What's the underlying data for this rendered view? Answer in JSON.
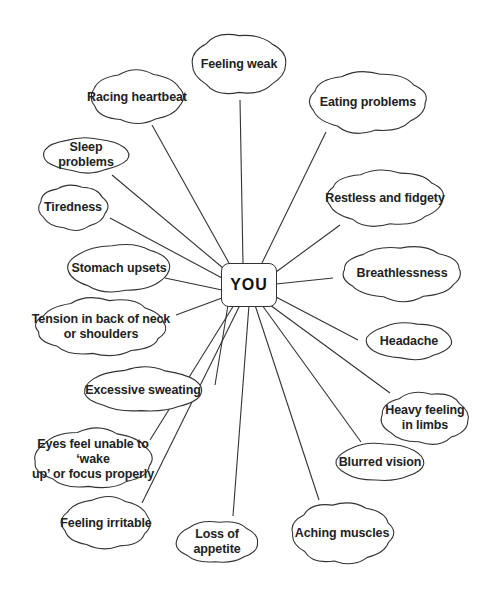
{
  "diagram": {
    "type": "mind-map",
    "center": {
      "label": "YOU",
      "x": 248,
      "y": 284
    },
    "line_color": "#333333",
    "background": "#ffffff",
    "nodes": [
      {
        "id": "feeling-weak",
        "label": "Feeling weak",
        "x": 183,
        "y": 28,
        "w": 112,
        "h": 72,
        "anchor": [
          240,
          100
        ]
      },
      {
        "id": "racing-heartbeat",
        "label": "Racing heartbeat",
        "x": 82,
        "y": 66,
        "w": 110,
        "h": 62,
        "anchor": [
          152,
          125
        ]
      },
      {
        "id": "eating-problems",
        "label": "Eating problems",
        "x": 300,
        "y": 66,
        "w": 136,
        "h": 72,
        "anchor": [
          326,
          132
        ]
      },
      {
        "id": "sleep-problems",
        "label": "Sleep\nproblems",
        "x": 34,
        "y": 133,
        "w": 104,
        "h": 44,
        "anchor": [
          112,
          175
        ]
      },
      {
        "id": "restless-fidgety",
        "label": "Restless and fidgety",
        "x": 317,
        "y": 165,
        "w": 136,
        "h": 66,
        "anchor": [
          340,
          225
        ]
      },
      {
        "id": "tiredness",
        "label": "Tiredness",
        "x": 32,
        "y": 180,
        "w": 82,
        "h": 55,
        "anchor": [
          110,
          218
        ]
      },
      {
        "id": "stomach-upsets",
        "label": "Stomach upsets",
        "x": 58,
        "y": 239,
        "w": 122,
        "h": 58,
        "anchor": [
          165,
          278
        ]
      },
      {
        "id": "breathlessness",
        "label": "Breathlessness",
        "x": 333,
        "y": 241,
        "w": 138,
        "h": 64,
        "anchor": [
          333,
          278
        ]
      },
      {
        "id": "tension-neck",
        "label": "Tension in back of neck\nor shoulders",
        "x": 26,
        "y": 293,
        "w": 150,
        "h": 68,
        "anchor": [
          176,
          315
        ]
      },
      {
        "id": "headache",
        "label": "Headache",
        "x": 357,
        "y": 318,
        "w": 104,
        "h": 46,
        "anchor": [
          358,
          340
        ]
      },
      {
        "id": "excessive-sweating",
        "label": "Excessive sweating",
        "x": 73,
        "y": 363,
        "w": 140,
        "h": 54,
        "anchor": [
          215,
          385
        ]
      },
      {
        "id": "heavy-limbs",
        "label": "Heavy feeling\nin limbs",
        "x": 373,
        "y": 387,
        "w": 104,
        "h": 62,
        "anchor": [
          390,
          393
        ]
      },
      {
        "id": "eyes-focus",
        "label": "Eyes feel unable to ‘wake\nup’ or focus properly",
        "x": 24,
        "y": 424,
        "w": 138,
        "h": 70,
        "anchor": [
          150,
          440
        ]
      },
      {
        "id": "blurred-vision",
        "label": "Blurred vision",
        "x": 327,
        "y": 438,
        "w": 106,
        "h": 48,
        "anchor": [
          361,
          442
        ]
      },
      {
        "id": "feeling-irritable",
        "label": "Feeling irritable",
        "x": 54,
        "y": 492,
        "w": 104,
        "h": 62,
        "anchor": [
          142,
          503
        ]
      },
      {
        "id": "loss-appetite",
        "label": "Loss of\nappetite",
        "x": 168,
        "y": 516,
        "w": 98,
        "h": 52,
        "anchor": [
          233,
          516
        ]
      },
      {
        "id": "aching-muscles",
        "label": "Aching muscles",
        "x": 283,
        "y": 497,
        "w": 118,
        "h": 72,
        "anchor": [
          319,
          500
        ]
      }
    ],
    "edges": [
      {
        "from": "YOU",
        "to": "feeling-weak",
        "start": [
          243,
          263
        ]
      },
      {
        "from": "YOU",
        "to": "racing-heartbeat",
        "start": [
          229,
          263
        ]
      },
      {
        "from": "YOU",
        "to": "eating-problems",
        "start": [
          262,
          263
        ]
      },
      {
        "from": "YOU",
        "to": "sleep-problems",
        "start": [
          223,
          268
        ]
      },
      {
        "from": "YOU",
        "to": "restless-fidgety",
        "start": [
          276,
          272
        ]
      },
      {
        "from": "YOU",
        "to": "tiredness",
        "start": [
          222,
          278
        ]
      },
      {
        "from": "YOU",
        "to": "stomach-upsets",
        "start": [
          222,
          290
        ]
      },
      {
        "from": "YOU",
        "to": "breathlessness",
        "start": [
          276,
          284
        ]
      },
      {
        "from": "YOU",
        "to": "tension-neck",
        "start": [
          222,
          298
        ]
      },
      {
        "from": "YOU",
        "to": "headache",
        "start": [
          276,
          297
        ]
      },
      {
        "from": "YOU",
        "to": "excessive-sweating",
        "start": [
          228,
          305
        ]
      },
      {
        "from": "YOU",
        "to": "heavy-limbs",
        "start": [
          270,
          305
        ]
      },
      {
        "from": "YOU",
        "to": "eyes-focus",
        "start": [
          234,
          305
        ]
      },
      {
        "from": "YOU",
        "to": "blurred-vision",
        "start": [
          262,
          305
        ]
      },
      {
        "from": "YOU",
        "to": "feeling-irritable",
        "start": [
          240,
          305
        ]
      },
      {
        "from": "YOU",
        "to": "loss-appetite",
        "start": [
          249,
          305
        ]
      },
      {
        "from": "YOU",
        "to": "aching-muscles",
        "start": [
          255,
          305
        ]
      }
    ]
  }
}
